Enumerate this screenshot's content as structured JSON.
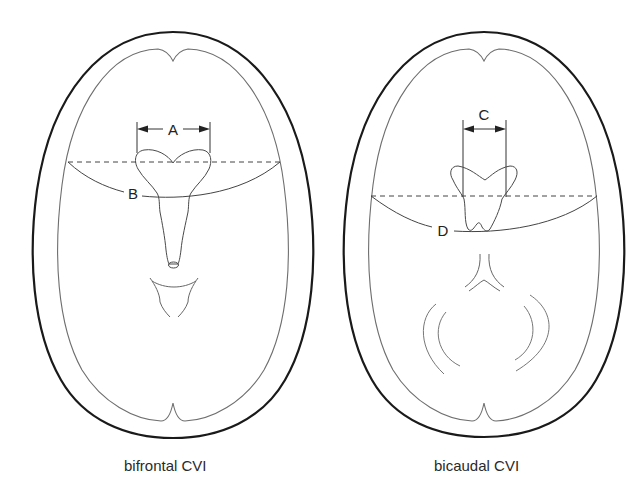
{
  "figure": {
    "panels": [
      {
        "id": "bifrontal",
        "caption": "bifrontal CVI",
        "labels": {
          "ventricle_width": "A",
          "brain_width": "B"
        }
      },
      {
        "id": "bicaudal",
        "caption": "bicaudal CVI",
        "labels": {
          "ventricle_width": "C",
          "brain_width": "D"
        }
      }
    ]
  },
  "colors": {
    "skull_outline": "#1a1a1a",
    "brain_outline": "#6e6e6e",
    "structure_lines": "#555555",
    "background": "#ffffff"
  }
}
